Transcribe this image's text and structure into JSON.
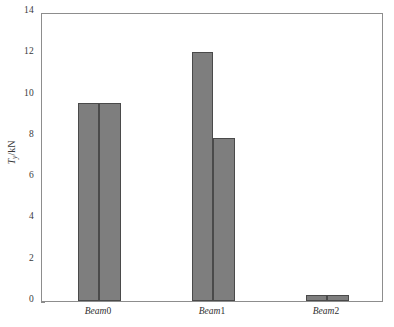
{
  "chart_data": {
    "type": "bar",
    "title": "",
    "xlabel": "",
    "ylabel": "Ty/kN",
    "ylabel_parts": {
      "symbol": "T",
      "subscript": "y",
      "unit": "/kN"
    },
    "categories": [
      "Beam0",
      "Beam1",
      "Beam2"
    ],
    "category_parts": [
      {
        "name": "Beam",
        "index": "0"
      },
      {
        "name": "Beam",
        "index": "1"
      },
      {
        "name": "Beam",
        "index": "2"
      }
    ],
    "series": [
      {
        "name": "series-1",
        "values": [
          9.6,
          12.05,
          0.3
        ]
      },
      {
        "name": "series-2",
        "values": [
          9.6,
          7.9,
          0.3
        ]
      }
    ],
    "ylim": [
      0,
      14
    ],
    "yticks": [
      0,
      2,
      4,
      6,
      8,
      10,
      12,
      14
    ],
    "ytick_labels": [
      "0",
      "2",
      "4",
      "6",
      "8",
      "10",
      "12",
      "14"
    ],
    "grid": false,
    "legend": "none",
    "bar_color": "#7e7e7e",
    "bar_edge_color": "#4a4a4a",
    "axis_color": "#8d8d8d",
    "background": "#ffffff"
  }
}
